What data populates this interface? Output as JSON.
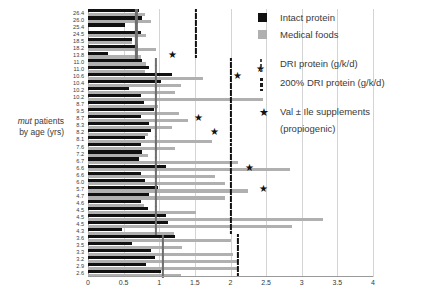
{
  "axis_title": {
    "line1_italic": "mut",
    "line1_rest": " patients",
    "line2": "by age (yrs)"
  },
  "legend": {
    "intact_label": "Intact protein",
    "medical_label": "Medical foods",
    "dri_label": "DRI protein (g/k/d)",
    "dri200_label": "200% DRI protein (g/k/d)",
    "star_label": "Val ± Ile supplements",
    "star_sub": "(propiogenic)"
  },
  "colors": {
    "intact": "#111111",
    "medical": "#b0b0b0",
    "dri": "#6e6e6e",
    "dri200": "#111111",
    "grid": "#d4d4d4",
    "axis": "#9a9a9a"
  },
  "chart_data": {
    "type": "bar",
    "orientation": "horizontal",
    "title": "",
    "xlabel": "",
    "ylabel": "mut patients by age (yrs)",
    "xlim": [
      0,
      4
    ],
    "xticks": [
      0,
      0.5,
      1,
      1.5,
      2,
      2.5,
      3,
      3.5,
      4
    ],
    "xticklabels": [
      "0",
      "0.5",
      "1",
      "1.5",
      "2",
      "2.5",
      "3",
      "3.5",
      "4"
    ],
    "grid": true,
    "legend_position": "right",
    "categories": [
      "26.4",
      "26.0",
      "25.4",
      "24.5",
      "18.5",
      "18.2",
      "13.8",
      "11.0",
      "11.0",
      "10.6",
      "10.4",
      "10.2",
      "10.2",
      "8.7",
      "9.5",
      "8.7",
      "8.3",
      "8.2",
      "8.1",
      "7.6",
      "7.2",
      "6.7",
      "6.6",
      "6.6",
      "6.0",
      "5.7",
      "4.7",
      "4.6",
      "4.5",
      "4.5",
      "4.5",
      "4.3",
      "3.6",
      "3.5",
      "3.3",
      "3.2",
      "2.9",
      "2.6"
    ],
    "series": [
      {
        "name": "Intact protein",
        "color": "#111111",
        "values": [
          0.72,
          0.76,
          0.52,
          0.74,
          0.62,
          0.7,
          0.28,
          0.76,
          0.85,
          1.18,
          1.02,
          0.58,
          0.74,
          0.78,
          0.93,
          0.74,
          0.86,
          0.88,
          0.8,
          0.74,
          0.76,
          0.72,
          1.1,
          0.74,
          0.8,
          0.98,
          0.86,
          0.74,
          0.84,
          1.1,
          1.12,
          0.48,
          1.22,
          0.62,
          0.88,
          0.94,
          0.82,
          1.02
        ]
      },
      {
        "name": "Medical foods",
        "color": "#b0b0b0",
        "values": [
          0.8,
          0.88,
          0.0,
          0.82,
          0.62,
          0.96,
          0.74,
          0.82,
          0.8,
          1.62,
          1.3,
          1.22,
          2.46,
          0.98,
          1.28,
          1.4,
          1.18,
          0.84,
          1.74,
          1.22,
          0.84,
          2.1,
          2.84,
          1.78,
          1.92,
          2.24,
          1.92,
          0.78,
          1.52,
          3.3,
          2.86,
          1.2,
          2.0,
          1.32,
          2.04,
          2.1,
          2.1,
          1.3
        ]
      }
    ],
    "dri_markers": {
      "label": "DRI protein (g/k/d)",
      "color": "#6e6e6e",
      "values": [
        0.68,
        0.68,
        0.68,
        0.68,
        0.68,
        0.68,
        0.68,
        0.95,
        0.95,
        0.95,
        0.95,
        0.95,
        0.95,
        0.95,
        0.95,
        0.95,
        0.95,
        0.95,
        0.95,
        0.95,
        0.95,
        0.95,
        0.95,
        0.95,
        0.95,
        0.95,
        0.95,
        0.95,
        0.95,
        0.95,
        0.95,
        0.95,
        1.05,
        1.05,
        1.05,
        1.05,
        1.05,
        1.05
      ]
    },
    "dri200_markers": {
      "label": "200% DRI protein (g/k/d)",
      "color": "#111111",
      "values": [
        1.52,
        1.52,
        1.52,
        1.52,
        1.52,
        1.52,
        1.52,
        2.0,
        2.0,
        2.0,
        2.0,
        2.0,
        2.0,
        2.0,
        2.0,
        2.0,
        2.0,
        2.0,
        2.0,
        2.0,
        2.0,
        2.0,
        2.0,
        2.0,
        2.0,
        2.0,
        2.0,
        2.0,
        2.0,
        2.0,
        2.0,
        2.0,
        2.1,
        2.1,
        2.1,
        2.1,
        2.1,
        2.1
      ]
    },
    "star_markers": {
      "label": "Val ± Ile supplements (propiogenic)",
      "points": [
        {
          "row": 6,
          "x": 1.18
        },
        {
          "row": 8,
          "x": 2.42
        },
        {
          "row": 9,
          "x": 2.1
        },
        {
          "row": 15,
          "x": 1.55
        },
        {
          "row": 17,
          "x": 1.78
        },
        {
          "row": 22,
          "x": 2.26
        },
        {
          "row": 25,
          "x": 2.46
        }
      ]
    }
  }
}
